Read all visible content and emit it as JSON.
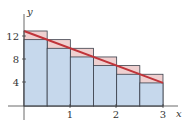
{
  "chart_data": {
    "type": "bar",
    "title": "",
    "xlabel": "x",
    "ylabel": "y",
    "function": "y = 13 - 3x",
    "interval": [
      0,
      3
    ],
    "n": 6,
    "dx": 0.5,
    "x_ticks": [
      1,
      2,
      3
    ],
    "y_ticks": [
      4,
      8,
      12
    ],
    "xlim": [
      0,
      3
    ],
    "ylim": [
      0,
      13
    ],
    "grid": false,
    "legend": "none",
    "categories": [
      "0–0.5",
      "0.5–1",
      "1–1.5",
      "1.5–2",
      "2–2.5",
      "2.5–3"
    ],
    "series": [
      {
        "name": "upper rectangles (left endpoints)",
        "values": [
          13,
          11.5,
          10,
          8.5,
          7,
          5.5
        ],
        "color": "#efd0d0"
      },
      {
        "name": "lower rectangles (right endpoints)",
        "values": [
          11.5,
          10,
          8.5,
          7,
          5.5,
          4
        ],
        "color": "#c6d8ec"
      }
    ],
    "line": {
      "name": "y = 13 - 3x",
      "x": [
        0,
        3
      ],
      "y": [
        13,
        4
      ],
      "color": "#c0343a"
    }
  },
  "labels": {
    "x_axis": "x",
    "y_axis": "y",
    "x_tick_1": "1",
    "x_tick_2": "2",
    "x_tick_3": "3",
    "y_tick_4": "4",
    "y_tick_8": "8",
    "y_tick_12": "12"
  }
}
